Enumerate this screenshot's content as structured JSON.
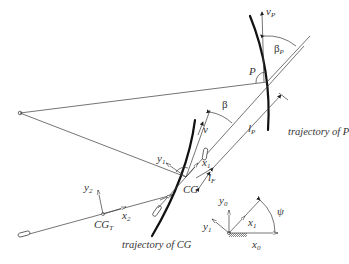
{
  "labels": {
    "vP": {
      "base": "v",
      "sub": "P"
    },
    "betaP": {
      "base": "β",
      "sub": "P"
    },
    "P": "P",
    "beta": "β",
    "v": "v",
    "lP": {
      "base": "l",
      "sub": "P"
    },
    "lF": {
      "base": "l",
      "sub": "F"
    },
    "x1": {
      "base": "x",
      "sub": "1"
    },
    "y1": {
      "base": "y",
      "sub": "1"
    },
    "CG": "CG",
    "CGT": {
      "base": "CG",
      "sub": "T"
    },
    "x2": {
      "base": "x",
      "sub": "2"
    },
    "y2": {
      "base": "y",
      "sub": "2"
    },
    "y0": {
      "base": "y",
      "sub": "0"
    },
    "x0": {
      "base": "x",
      "sub": "0"
    },
    "x1_inertial": {
      "base": "x",
      "sub": "1"
    },
    "y1_inertial": {
      "base": "y",
      "sub": "1"
    },
    "psi": "ψ"
  },
  "captions": {
    "trajectory_P": "trajectory of P",
    "trajectory_CG": "trajectory of CG"
  }
}
